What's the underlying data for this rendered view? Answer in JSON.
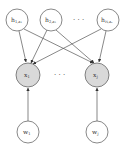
{
  "diagram": {
    "type": "graphical-model",
    "colors": {
      "stroke": "#555555",
      "observed_fill": "#d9d9d9",
      "latent_fill": "#ffffff"
    },
    "top_nodes": [
      {
        "id": "h1",
        "main": "h",
        "sub": "1,a₁",
        "cx": 17,
        "cy": 20
      },
      {
        "id": "h2",
        "main": "h",
        "sub": "2,a₂",
        "cx": 51,
        "cy": 20
      },
      {
        "id": "hN",
        "main": "h",
        "sub": "N,aₙ",
        "cx": 108,
        "cy": 20
      }
    ],
    "top_ellipsis": "· · ·",
    "middle_nodes": [
      {
        "id": "x1",
        "main": "x",
        "sub": "1",
        "cx": 28,
        "cy": 75,
        "observed": true
      },
      {
        "id": "xJ",
        "main": "x",
        "sub": "J",
        "cx": 97,
        "cy": 75,
        "observed": true
      }
    ],
    "middle_ellipsis": "· · ·",
    "bottom_nodes": [
      {
        "id": "w1",
        "main": "w",
        "sub": "1",
        "cx": 28,
        "cy": 132
      },
      {
        "id": "wJ",
        "main": "w",
        "sub": "J",
        "cx": 97,
        "cy": 132
      }
    ],
    "edges": [
      [
        "h1",
        "x1"
      ],
      [
        "h1",
        "xJ"
      ],
      [
        "h2",
        "x1"
      ],
      [
        "h2",
        "xJ"
      ],
      [
        "hN",
        "x1"
      ],
      [
        "hN",
        "xJ"
      ],
      [
        "w1",
        "x1"
      ],
      [
        "wJ",
        "xJ"
      ]
    ]
  }
}
